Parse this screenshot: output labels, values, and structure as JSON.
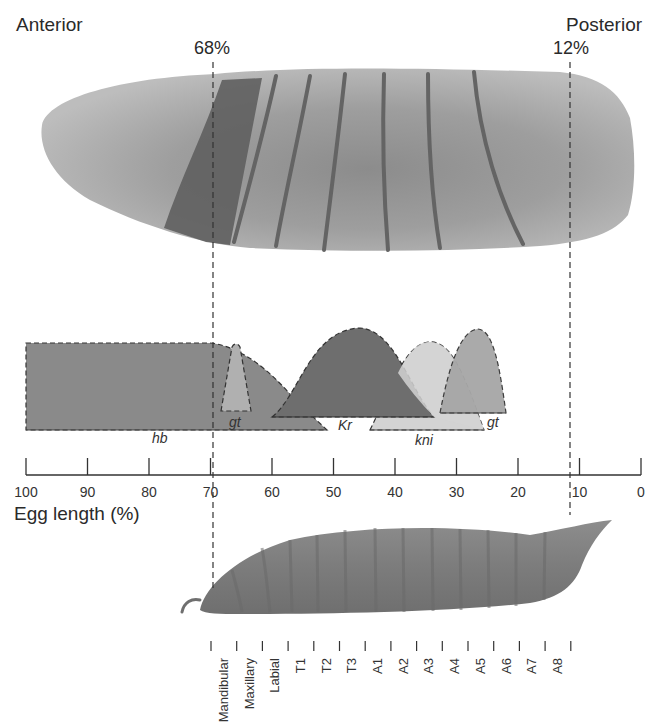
{
  "labels": {
    "anterior": "Anterior",
    "posterior": "Posterior",
    "boundary_left": "68%",
    "boundary_right": "12%",
    "axis_title": "Egg length (%)"
  },
  "axis": {
    "ticks": [
      "100",
      "90",
      "80",
      "70",
      "60",
      "50",
      "40",
      "30",
      "20",
      "10",
      "0"
    ]
  },
  "gap_genes": [
    {
      "name": "hb",
      "label": "hb",
      "color": "#8a8a8a"
    },
    {
      "name": "gt-anterior",
      "label": "gt",
      "color": "#b0b0b0"
    },
    {
      "name": "Kr",
      "label": "Kr",
      "color": "#6e6e6e"
    },
    {
      "name": "kni",
      "label": "kni",
      "color": "#d2d2d2"
    },
    {
      "name": "gt-posterior",
      "label": "gt",
      "color": "#a6a6a6"
    }
  ],
  "segments": [
    "Mandibular",
    "Maxillary",
    "Labial",
    "T1",
    "T2",
    "T3",
    "A1",
    "A2",
    "A3",
    "A4",
    "A5",
    "A6",
    "A7",
    "A8"
  ],
  "colors": {
    "embryo_light": "#b9b9b9",
    "embryo_mid": "#9a9a9a",
    "embryo_dark": "#8a8a8a",
    "stripe": "#6a6a6a",
    "larva": "#7f7f7f"
  }
}
